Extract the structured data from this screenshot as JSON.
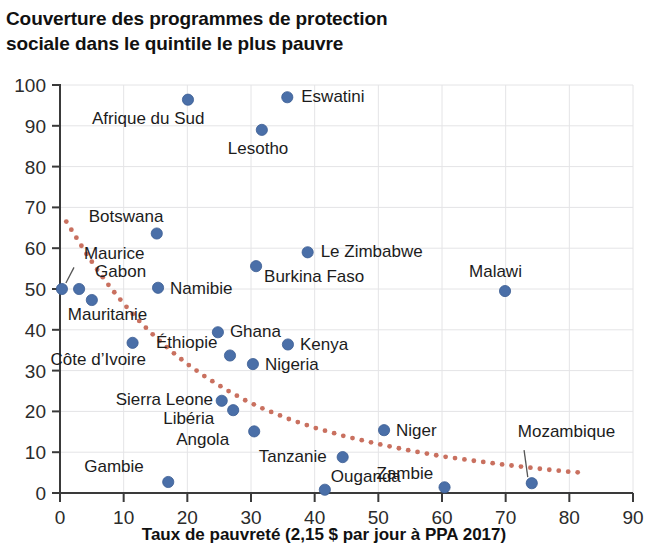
{
  "title": "Couverture des programmes de protection\nsociale dans le quintile le plus pauvre",
  "colors": {
    "dot": "#4a6fa8",
    "trend": "#c9705f",
    "grid": "#e4e4e6",
    "axis": "#3a3a3a",
    "text": "#1c1c1c"
  },
  "chart_data": {
    "type": "scatter",
    "title": "Couverture des programmes de protection sociale dans le quintile le plus pauvre",
    "xlabel": "Taux de pauvreté (2,15 $ par jour à PPA 2017)",
    "ylabel": "",
    "xlim": [
      0,
      90
    ],
    "ylim": [
      0,
      100
    ],
    "xticks": [
      0,
      10,
      20,
      30,
      40,
      50,
      60,
      70,
      80,
      90
    ],
    "yticks": [
      0,
      10,
      20,
      30,
      40,
      50,
      60,
      70,
      80,
      90,
      100
    ],
    "grid": true,
    "legend": "none",
    "points": [
      {
        "label": "Maurice",
        "x": 0.3,
        "y": 50.0,
        "lx": 22,
        "ly": -30,
        "anchor": "start",
        "leader": true
      },
      {
        "label": "Gabon",
        "x": 3.0,
        "y": 50.0,
        "lx": 16,
        "ly": -12,
        "anchor": "start",
        "leader": false
      },
      {
        "label": "Mauritanie",
        "x": 5.0,
        "y": 47.3,
        "lx": -24,
        "ly": 20,
        "anchor": "start",
        "leader": false
      },
      {
        "label": "Côte d’Ivoire",
        "x": 11.4,
        "y": 36.8,
        "lx": -82,
        "ly": 22,
        "anchor": "start",
        "leader": false
      },
      {
        "label": "Botswana",
        "x": 15.2,
        "y": 63.6,
        "lx": -68,
        "ly": -12,
        "anchor": "start",
        "leader": false
      },
      {
        "label": "Namibie",
        "x": 15.4,
        "y": 50.3,
        "lx": 12,
        "ly": 6,
        "anchor": "start",
        "leader": false
      },
      {
        "label": "Gambie",
        "x": 17.0,
        "y": 2.7,
        "lx": -84,
        "ly": -10,
        "anchor": "start",
        "leader": false
      },
      {
        "label": "Afrique du Sud",
        "x": 20.1,
        "y": 96.4,
        "lx": -96,
        "ly": 24,
        "anchor": "start",
        "leader": false
      },
      {
        "label": "Ghana",
        "x": 24.8,
        "y": 39.4,
        "lx": 12,
        "ly": 5,
        "anchor": "start",
        "leader": false
      },
      {
        "label": "Sierra Leone",
        "x": 25.4,
        "y": 22.6,
        "lx": -106,
        "ly": 4,
        "anchor": "start",
        "leader": false
      },
      {
        "label": "Éthiopie",
        "x": 26.7,
        "y": 33.7,
        "lx": -74,
        "ly": -8,
        "anchor": "start",
        "leader": false
      },
      {
        "label": "Libéria",
        "x": 27.2,
        "y": 20.3,
        "lx": -70,
        "ly": 14,
        "anchor": "start",
        "leader": false
      },
      {
        "label": "Nigeria",
        "x": 30.3,
        "y": 31.6,
        "lx": 12,
        "ly": 6,
        "anchor": "start",
        "leader": false
      },
      {
        "label": "Angola",
        "x": 30.5,
        "y": 15.1,
        "lx": -78,
        "ly": 14,
        "anchor": "start",
        "leader": false
      },
      {
        "label": "Burkina Faso",
        "x": 30.8,
        "y": 55.6,
        "lx": 8,
        "ly": 16,
        "anchor": "start",
        "leader": false
      },
      {
        "label": "Lesotho",
        "x": 31.7,
        "y": 89.0,
        "lx": -34,
        "ly": 24,
        "anchor": "start",
        "leader": false
      },
      {
        "label": "Kenya",
        "x": 35.8,
        "y": 36.4,
        "lx": 12,
        "ly": 6,
        "anchor": "start",
        "leader": false
      },
      {
        "label": "Eswatini",
        "x": 35.7,
        "y": 97.0,
        "lx": 14,
        "ly": 5,
        "anchor": "start",
        "leader": false
      },
      {
        "label": "Le Zimbabwe",
        "x": 38.9,
        "y": 59.0,
        "lx": 13,
        "ly": 5,
        "anchor": "start",
        "leader": false
      },
      {
        "label": "Ouganda",
        "x": 41.6,
        "y": 0.8,
        "lx": 6,
        "ly": -8,
        "anchor": "start",
        "leader": false
      },
      {
        "label": "Tanzanie",
        "x": 44.4,
        "y": 8.8,
        "lx": -84,
        "ly": 5,
        "anchor": "start",
        "leader": false
      },
      {
        "label": "Niger",
        "x": 50.9,
        "y": 15.4,
        "lx": 12,
        "ly": 6,
        "anchor": "start",
        "leader": false
      },
      {
        "label": "Zambie",
        "x": 60.4,
        "y": 1.4,
        "lx": -68,
        "ly": -8,
        "anchor": "start",
        "leader": false
      },
      {
        "label": "Malawi",
        "x": 69.9,
        "y": 49.5,
        "lx": -36,
        "ly": -14,
        "anchor": "start",
        "leader": false
      },
      {
        "label": "Mozambique",
        "x": 74.1,
        "y": 2.4,
        "lx": -14,
        "ly": -46,
        "anchor": "start",
        "leader": true
      }
    ],
    "trendline": {
      "style": "dotted",
      "color": "#c9705f",
      "points": [
        {
          "x": 0.2,
          "y": 68.5
        },
        {
          "x": 2.0,
          "y": 64.0
        },
        {
          "x": 4.0,
          "y": 59.0
        },
        {
          "x": 6.0,
          "y": 54.4
        },
        {
          "x": 8.0,
          "y": 50.2
        },
        {
          "x": 10.0,
          "y": 46.4
        },
        {
          "x": 12.0,
          "y": 42.9
        },
        {
          "x": 14.0,
          "y": 39.7
        },
        {
          "x": 16.0,
          "y": 36.8
        },
        {
          "x": 18.0,
          "y": 34.1
        },
        {
          "x": 20.0,
          "y": 31.6
        },
        {
          "x": 23.0,
          "y": 28.3
        },
        {
          "x": 26.0,
          "y": 25.4
        },
        {
          "x": 29.0,
          "y": 22.8
        },
        {
          "x": 32.0,
          "y": 20.6
        },
        {
          "x": 36.0,
          "y": 18.1
        },
        {
          "x": 40.0,
          "y": 16.0
        },
        {
          "x": 45.0,
          "y": 13.8
        },
        {
          "x": 50.0,
          "y": 12.0
        },
        {
          "x": 55.0,
          "y": 10.4
        },
        {
          "x": 60.0,
          "y": 9.0
        },
        {
          "x": 65.0,
          "y": 7.9
        },
        {
          "x": 70.0,
          "y": 6.9
        },
        {
          "x": 75.0,
          "y": 6.0
        },
        {
          "x": 80.0,
          "y": 5.2
        },
        {
          "x": 82.0,
          "y": 5.0
        }
      ]
    }
  }
}
